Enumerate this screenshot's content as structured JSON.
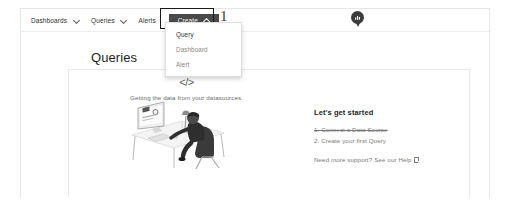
{
  "nav": {
    "items": [
      {
        "label": "Dashboards",
        "icon": "chevron-down-icon",
        "has_chevron": true
      },
      {
        "label": "Queries",
        "icon": "chevron-down-icon",
        "has_chevron": true
      },
      {
        "label": "Alerts",
        "has_chevron": false
      }
    ],
    "create_button": {
      "label": "Create",
      "icon": "chevron-up-icon",
      "state": "expanded",
      "background": "#4a4a4a",
      "text_color": "#ffffff"
    },
    "avatar": {
      "icon": "brand-badge-icon"
    }
  },
  "create_menu": {
    "items": [
      {
        "label": "Query",
        "highlighted": true
      },
      {
        "label": "Dashboard",
        "highlighted": false
      },
      {
        "label": "Alert",
        "highlighted": false
      }
    ]
  },
  "annotations": [
    {
      "number": "1",
      "target": "create-button"
    },
    {
      "number": "2",
      "target": "menu-item-query"
    }
  ],
  "page": {
    "title": "Queries"
  },
  "empty_state": {
    "glyph": "</>",
    "caption": "Getting the data from your datasources.",
    "illustration": "person-at-desk-illustration"
  },
  "get_started": {
    "title": "Let's get started",
    "steps": [
      {
        "text": "1. Connect a Data Source",
        "completed": true
      },
      {
        "text": "2. Create your first Query",
        "completed": false
      }
    ],
    "support_prefix": "Need more support?",
    "support_link": "See our Help",
    "support_icon": "external-link-icon"
  },
  "colors": {
    "accent": "#4a4a4a",
    "border": "#e8e8e8",
    "muted_text": "#7a7a7a"
  }
}
